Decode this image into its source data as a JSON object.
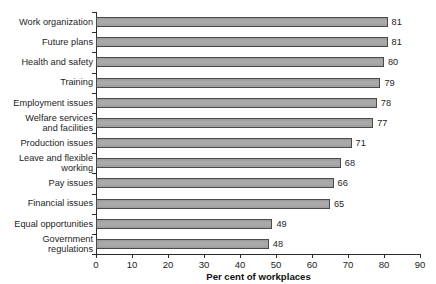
{
  "chart_data": {
    "type": "bar",
    "orientation": "horizontal",
    "title": "",
    "xlabel": "Per cent of workplaces",
    "ylabel": "",
    "xlim": [
      0,
      90
    ],
    "xticks": [
      0,
      10,
      20,
      30,
      40,
      50,
      60,
      70,
      80,
      90
    ],
    "grid": false,
    "legend": null,
    "categories": [
      "Work organization",
      "Future plans",
      "Health and safety",
      "Training",
      "Employment issues",
      "Welfare services\nand facilities",
      "Production issues",
      "Leave and flexible\nworking",
      "Pay issues",
      "Financial issues",
      "Equal opportunities",
      "Government\nregulations"
    ],
    "values": [
      81,
      81,
      80,
      79,
      78,
      77,
      71,
      68,
      66,
      65,
      49,
      48
    ],
    "data_labels": [
      "81",
      "81",
      "80",
      "79",
      "78",
      "77",
      "71",
      "68",
      "66",
      "65",
      "49",
      "48"
    ],
    "colors": {
      "bar_fill": "#a6a6a6",
      "bar_border": "#4a4a4a",
      "axis": "#2b2b2b",
      "text": "#1d1d1d",
      "background": "#ffffff"
    }
  }
}
